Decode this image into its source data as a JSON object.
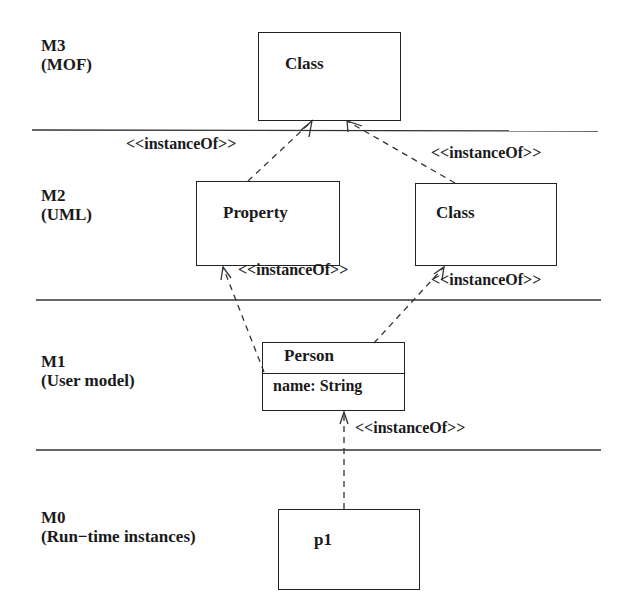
{
  "layers": [
    {
      "id": "M3",
      "label": "M3",
      "subtitle": "(MOF)"
    },
    {
      "id": "M2",
      "label": "M2",
      "subtitle": "(UML)"
    },
    {
      "id": "M1",
      "label": "M1",
      "subtitle": "(User model)"
    },
    {
      "id": "M0",
      "label": "M0",
      "subtitle": "(Run−time instances)"
    }
  ],
  "elements": {
    "m3_class": {
      "name": "Class"
    },
    "m2_property": {
      "name": "Property"
    },
    "m2_class": {
      "name": "Class"
    },
    "m1_person": {
      "name": "Person",
      "attribute": "name: String"
    },
    "m0_p1": {
      "name": "p1"
    }
  },
  "relations": [
    {
      "from": "m2_property",
      "to": "m3_class",
      "label": "<<instanceOf>>"
    },
    {
      "from": "m2_class",
      "to": "m3_class",
      "label": "<<instanceOf>>"
    },
    {
      "from": "m1_person",
      "to": "m2_property",
      "label": "<<instanceOf>>"
    },
    {
      "from": "m1_person",
      "to": "m2_class",
      "label": "<<instanceOf>>"
    },
    {
      "from": "m0_p1",
      "to": "m1_person",
      "label": "<<instanceOf>>"
    }
  ]
}
